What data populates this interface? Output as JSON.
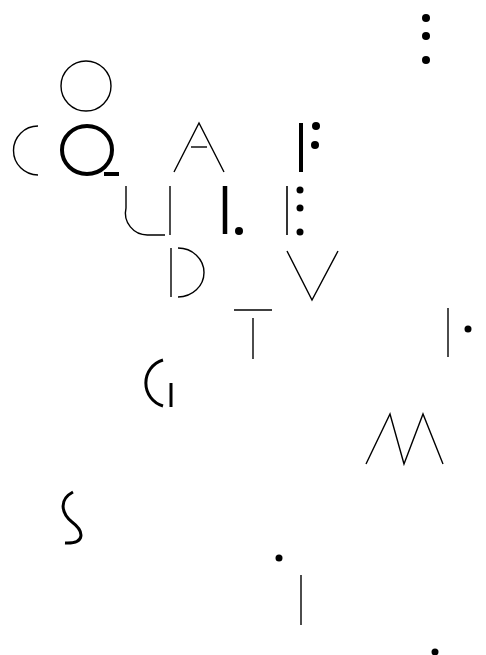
{
  "artwork": {
    "background": "#ffffff",
    "ink": "#000000",
    "glyphs": [
      {
        "id": "o-thin",
        "letter": "O"
      },
      {
        "id": "c-thin",
        "letter": "C"
      },
      {
        "id": "q-bold",
        "letter": "Q"
      },
      {
        "id": "a-thin",
        "letter": "A"
      },
      {
        "id": "f-fragment",
        "letter": "F"
      },
      {
        "id": "u-thin",
        "letter": "U"
      },
      {
        "id": "i-dot",
        "letter": "I."
      },
      {
        "id": "e-fragment",
        "letter": "E"
      },
      {
        "id": "d-thin",
        "letter": "D"
      },
      {
        "id": "v-thin",
        "letter": "V"
      },
      {
        "id": "t-thin",
        "letter": "T"
      },
      {
        "id": "i-colon",
        "letter": "I"
      },
      {
        "id": "g-bold",
        "letter": "G"
      },
      {
        "id": "m-thin",
        "letter": "M"
      },
      {
        "id": "s-bold",
        "letter": "S"
      },
      {
        "id": "i-lower",
        "letter": "i"
      },
      {
        "id": "ellipsis-top",
        "letter": "⋮"
      },
      {
        "id": "dot-bottom",
        "letter": "."
      }
    ]
  }
}
